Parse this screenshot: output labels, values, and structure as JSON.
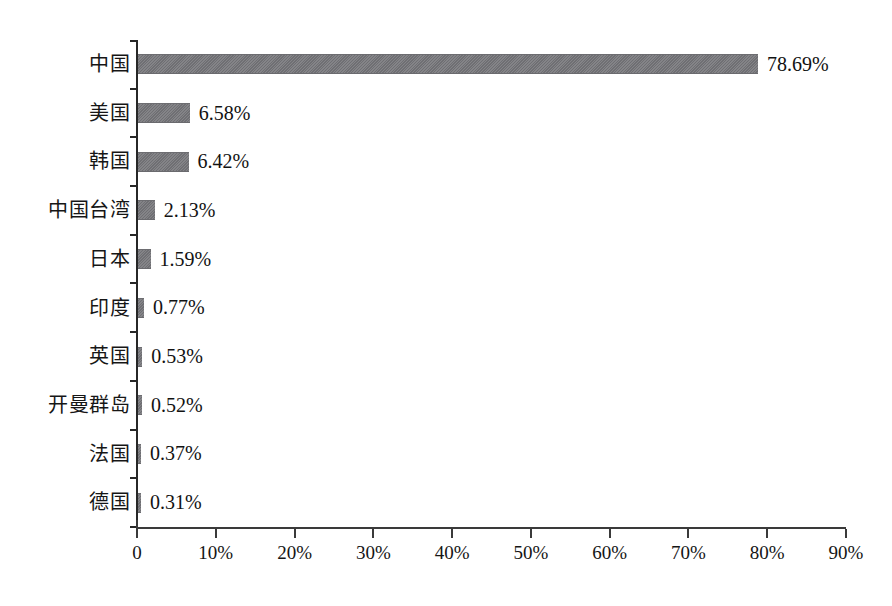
{
  "chart_data": {
    "type": "bar",
    "orientation": "horizontal",
    "title": "",
    "subtitle": "",
    "xlabel": "",
    "ylabel": "",
    "grid": false,
    "legend": false,
    "legend_position": "none",
    "xlim": [
      0,
      90
    ],
    "xtick_labels": [
      "0",
      "10%",
      "20%",
      "30%",
      "40%",
      "50%",
      "60%",
      "70%",
      "80%",
      "90%"
    ],
    "xtick_values": [
      0,
      10,
      20,
      30,
      40,
      50,
      60,
      70,
      80,
      90
    ],
    "bar_color": "#76767a",
    "axis_color": "#272727",
    "categories": [
      "中国",
      "美国",
      "韩国",
      "中国台湾",
      "日本",
      "印度",
      "英国",
      "开曼群岛",
      "法国",
      "德国"
    ],
    "values": [
      78.69,
      6.58,
      6.42,
      2.13,
      1.59,
      0.77,
      0.53,
      0.52,
      0.37,
      0.31
    ],
    "value_labels": [
      "78.69%",
      "6.58%",
      "6.42%",
      "2.13%",
      "1.59%",
      "0.77%",
      "0.53%",
      "0.52%",
      "0.37%",
      "0.31%"
    ],
    "bars": [
      {
        "category": "中国",
        "value": 78.69,
        "label": "78.69%"
      },
      {
        "category": "美国",
        "value": 6.58,
        "label": "6.58%"
      },
      {
        "category": "韩国",
        "value": 6.42,
        "label": "6.42%"
      },
      {
        "category": "中国台湾",
        "value": 2.13,
        "label": "2.13%"
      },
      {
        "category": "日本",
        "value": 1.59,
        "label": "1.59%"
      },
      {
        "category": "印度",
        "value": 0.77,
        "label": "0.77%"
      },
      {
        "category": "英国",
        "value": 0.53,
        "label": "0.53%"
      },
      {
        "category": "开曼群岛",
        "value": 0.52,
        "label": "0.52%"
      },
      {
        "category": "法国",
        "value": 0.37,
        "label": "0.37%"
      },
      {
        "category": "德国",
        "value": 0.31,
        "label": "0.31%"
      }
    ]
  }
}
